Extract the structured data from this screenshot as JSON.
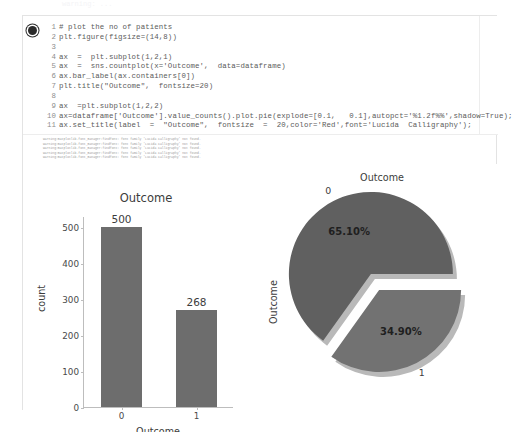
{
  "notebook": {
    "cell_marker": "cell-run-indicator",
    "code_lines": [
      {
        "n": "1",
        "text": "# plot the no of patients"
      },
      {
        "n": "2",
        "text": "plt.figure(figsize=(14,8))"
      },
      {
        "n": "3",
        "text": ""
      },
      {
        "n": "4",
        "text": "ax  =  plt.subplot(1,2,1)"
      },
      {
        "n": "5",
        "text": "ax  =  sns.countplot(x='Outcome',  data=dataframe)"
      },
      {
        "n": "6",
        "text": "ax.bar_label(ax.containers[0])"
      },
      {
        "n": "7",
        "text": "plt.title(\"Outcome\",  fontsize=20)"
      },
      {
        "n": "8",
        "text": ""
      },
      {
        "n": "9",
        "text": "ax  =plt.subplot(1,2,2)"
      },
      {
        "n": "10",
        "text": "ax=dataframe['Outcome'].value_counts().plot.pie(explode=[0.1,   0.1],autopct='%1.2f%%',shadow=True);"
      },
      {
        "n": "11",
        "text": "ax.set_title(label  =  \"Outcome\",  fontsize  =  20,color='Red',font='Lucida  Calligraphy');"
      }
    ],
    "warnings": [
      "warning:matplotlib.font_manager:findfont: font family 'Lucida Calligraphy' not found.",
      "warning:matplotlib.font_manager:findfont: font family 'Lucida Calligraphy' not found.",
      "warning:matplotlib.font_manager:findfont: font family 'Lucida Calligraphy' not found.",
      "warning:matplotlib.font_manager:findfont: font family 'Lucida Calligraphy' not found.",
      "warning:matplotlib.font_manager:findfont: font family 'Lucida Calligraphy' not found."
    ],
    "top_ghost_text": "warning: ..."
  },
  "chart_data": [
    {
      "type": "bar",
      "title": "Outcome",
      "xlabel": "Outcome",
      "ylabel": "count",
      "categories": [
        "0",
        "1"
      ],
      "values": [
        500,
        268
      ],
      "bar_labels": [
        "500",
        "268"
      ],
      "yticks": [
        0,
        100,
        200,
        300,
        400,
        500
      ],
      "ytick_labels": [
        "0",
        "100",
        "200",
        "300",
        "400",
        "500"
      ],
      "ylim": [
        0,
        530
      ],
      "grid": false,
      "bar_color": "#6d6d6d"
    },
    {
      "type": "pie",
      "title": "Outcome",
      "ylabel": "Outcome",
      "labels": [
        "0",
        "1"
      ],
      "values": [
        65.1,
        34.9
      ],
      "pct_labels": [
        "65.10%",
        "34.90%"
      ],
      "explode": [
        0.1,
        0.1
      ],
      "shadow": true,
      "slice_colors": [
        "#606060",
        "#727272"
      ],
      "startangle_note": "0 slice begins at right, counter-clockwise"
    }
  ],
  "colors": {
    "bar": "#6d6d6d",
    "pie_slice_0": "#606060",
    "pie_slice_1": "#727272",
    "axis": "#bdbdbd",
    "text": "#3c3c3c",
    "warning_text": "#9a9a9a",
    "frame": "#e3e3e3"
  }
}
